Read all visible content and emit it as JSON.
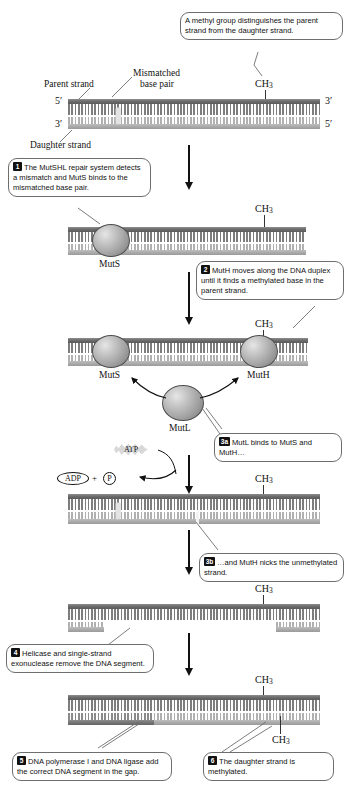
{
  "diagram": {
    "labels": {
      "parent_strand": "Parent strand",
      "daughter_strand": "Daughter strand",
      "mismatched_base_pair_l1": "Mismatched",
      "mismatched_base_pair_l2": "base pair",
      "five_prime": "5′",
      "three_prime": "3′",
      "methyl": "CH",
      "methyl_sub": "3",
      "muts": "MutS",
      "muth": "MutH",
      "mutl": "MutL",
      "atp": "ATP",
      "adp": "ADP",
      "phosphate": "P",
      "plus": "+"
    },
    "callouts": [
      {
        "id": "methyl-note",
        "number": "",
        "text": "A methyl group distinguishes the parent strand from the daughter strand."
      },
      {
        "id": "step-1",
        "number": "1",
        "text": "The MutSHL repair system detects a mismatch and MutS binds to the mismatched base pair."
      },
      {
        "id": "step-2",
        "number": "2",
        "text": "MutH moves along the DNA duplex until it finds a methylated base in the parent strand."
      },
      {
        "id": "step-3a",
        "number": "3a",
        "text": "MutL binds to MutS and MutH…"
      },
      {
        "id": "step-3b",
        "number": "3b",
        "text": "…and MutH nicks the unmethylated strand."
      },
      {
        "id": "step-4",
        "number": "4",
        "text": "Helicase and single-strand exonuclease remove the DNA segment."
      },
      {
        "id": "step-5",
        "number": "5",
        "text": "DNA polymerase I and DNA ligase add the correct DNA segment in the gap."
      },
      {
        "id": "step-6",
        "number": "6",
        "text": "The daughter strand is methylated."
      }
    ],
    "colors": {
      "parent_backbone": "#6d6d6d",
      "daughter_backbone": "#a9a9a9",
      "new_segment": "#737373",
      "protein": "#a6a6a6",
      "outline": "#4e4e4e",
      "callout_border": "#6e6e6e",
      "text": "#111111"
    }
  }
}
